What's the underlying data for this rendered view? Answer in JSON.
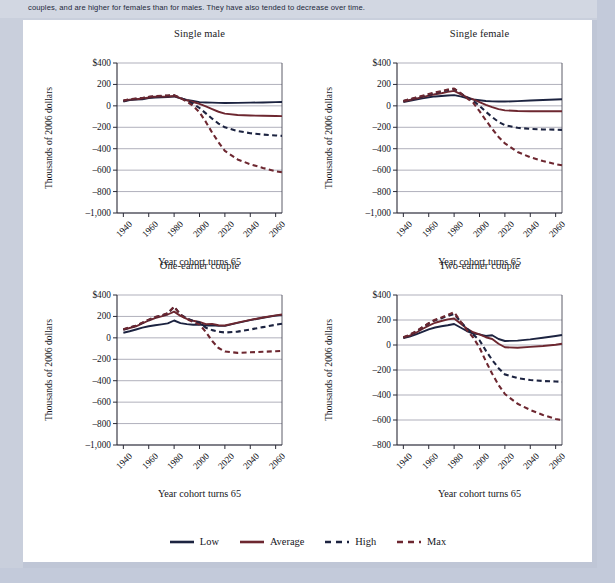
{
  "page": {
    "top_paragraph": "couples, and are higher for females than for males. They have also tended to decrease over time.",
    "background_color": "#c9cfdc",
    "panel_color": "#ffffff"
  },
  "legend": {
    "position": "bottom-center",
    "items": [
      {
        "label": "Low",
        "color": "#1c2340",
        "style": "solid"
      },
      {
        "label": "Average",
        "color": "#6d2730",
        "style": "solid"
      },
      {
        "label": "High",
        "color": "#1c2340",
        "style": "dashed"
      },
      {
        "label": "Max",
        "color": "#6d2730",
        "style": "dashed"
      }
    ]
  },
  "chart_data": [
    {
      "type": "line",
      "title": "Single male",
      "xlabel": "Year cohort turns 65",
      "ylabel": "Thousands of 2006 dollars",
      "xlim": [
        1935,
        2065
      ],
      "ylim": [
        -1000,
        400
      ],
      "xticks": [
        1940,
        1960,
        1980,
        2000,
        2020,
        2040,
        2060
      ],
      "yticks": [
        400,
        200,
        0,
        -200,
        -400,
        -600,
        -800,
        -1000
      ],
      "ytick_labels": [
        "$400",
        "200",
        "0",
        "–200",
        "–400",
        "–600",
        "–800",
        "–1,000"
      ],
      "grid": true,
      "x": [
        1940,
        1945,
        1950,
        1955,
        1960,
        1965,
        1970,
        1975,
        1980,
        1985,
        1990,
        1995,
        2000,
        2005,
        2010,
        2015,
        2020,
        2030,
        2040,
        2050,
        2060,
        2065
      ],
      "series": [
        {
          "name": "Low",
          "color": "#1c2340",
          "style": "solid",
          "values": [
            40,
            55,
            58,
            62,
            72,
            78,
            80,
            82,
            88,
            70,
            55,
            45,
            35,
            32,
            30,
            28,
            27,
            28,
            30,
            32,
            35,
            36
          ]
        },
        {
          "name": "Average",
          "color": "#6d2730",
          "style": "solid",
          "values": [
            45,
            58,
            62,
            68,
            78,
            85,
            86,
            88,
            92,
            72,
            52,
            36,
            18,
            -5,
            -30,
            -55,
            -72,
            -85,
            -90,
            -93,
            -95,
            -96
          ]
        },
        {
          "name": "High",
          "color": "#1c2340",
          "style": "dashed",
          "values": [
            48,
            60,
            66,
            72,
            82,
            90,
            92,
            94,
            98,
            74,
            48,
            20,
            -20,
            -70,
            -120,
            -165,
            -200,
            -235,
            -255,
            -268,
            -276,
            -280
          ]
        },
        {
          "name": "Max",
          "color": "#6d2730",
          "style": "dashed",
          "values": [
            50,
            62,
            68,
            74,
            84,
            92,
            94,
            96,
            100,
            72,
            40,
            0,
            -60,
            -150,
            -250,
            -340,
            -420,
            -500,
            -545,
            -580,
            -610,
            -620
          ]
        }
      ]
    },
    {
      "type": "line",
      "title": "Single female",
      "xlabel": "Year cohort turns 65",
      "ylabel": "Thousands of 2006 dollars",
      "xlim": [
        1935,
        2065
      ],
      "ylim": [
        -1000,
        400
      ],
      "xticks": [
        1940,
        1960,
        1980,
        2000,
        2020,
        2040,
        2060
      ],
      "yticks": [
        400,
        200,
        0,
        -200,
        -400,
        -600,
        -800,
        -1000
      ],
      "ytick_labels": [
        "$400",
        "200",
        "0",
        "–200",
        "–400",
        "–600",
        "–800",
        "–1,000"
      ],
      "grid": true,
      "x": [
        1940,
        1945,
        1950,
        1955,
        1960,
        1965,
        1970,
        1975,
        1980,
        1985,
        1990,
        1995,
        2000,
        2005,
        2010,
        2015,
        2020,
        2030,
        2040,
        2050,
        2060,
        2065
      ],
      "series": [
        {
          "name": "Low",
          "color": "#1c2340",
          "style": "solid",
          "values": [
            35,
            48,
            58,
            70,
            80,
            88,
            92,
            96,
            100,
            88,
            72,
            60,
            52,
            45,
            42,
            40,
            40,
            44,
            50,
            55,
            60,
            62
          ]
        },
        {
          "name": "Average",
          "color": "#6d2730",
          "style": "solid",
          "values": [
            40,
            55,
            68,
            82,
            95,
            108,
            118,
            130,
            140,
            110,
            82,
            60,
            35,
            10,
            -12,
            -30,
            -42,
            -48,
            -50,
            -50,
            -50,
            -50
          ]
        },
        {
          "name": "High",
          "color": "#1c2340",
          "style": "dashed",
          "values": [
            45,
            60,
            75,
            90,
            105,
            120,
            132,
            146,
            158,
            118,
            80,
            48,
            0,
            -55,
            -105,
            -150,
            -180,
            -205,
            -215,
            -220,
            -222,
            -224
          ]
        },
        {
          "name": "Max",
          "color": "#6d2730",
          "style": "dashed",
          "values": [
            46,
            62,
            78,
            94,
            110,
            125,
            138,
            152,
            162,
            118,
            72,
            30,
            -50,
            -135,
            -215,
            -290,
            -350,
            -430,
            -480,
            -515,
            -545,
            -555
          ]
        }
      ]
    },
    {
      "type": "line",
      "title": "One-earner couple",
      "xlabel": "Year cohort turns 65",
      "ylabel": "Thousands of 2006 dollars",
      "xlim": [
        1935,
        2065
      ],
      "ylim": [
        -1000,
        400
      ],
      "xticks": [
        1940,
        1960,
        1980,
        2000,
        2020,
        2040,
        2060
      ],
      "yticks": [
        400,
        200,
        0,
        -200,
        -400,
        -600,
        -800,
        -1000
      ],
      "ytick_labels": [
        "$400",
        "200",
        "0",
        "–200",
        "–400",
        "–600",
        "–800",
        "–1,000"
      ],
      "grid": true,
      "x": [
        1940,
        1945,
        1950,
        1955,
        1960,
        1965,
        1970,
        1975,
        1980,
        1985,
        1990,
        1995,
        2000,
        2005,
        2010,
        2015,
        2020,
        2030,
        2040,
        2050,
        2060,
        2065
      ],
      "series": [
        {
          "name": "Low",
          "color": "#1c2340",
          "style": "solid",
          "values": [
            48,
            62,
            78,
            95,
            108,
            118,
            126,
            135,
            162,
            138,
            128,
            122,
            125,
            115,
            118,
            112,
            112,
            140,
            165,
            188,
            208,
            215
          ]
        },
        {
          "name": "Average",
          "color": "#6d2730",
          "style": "solid",
          "values": [
            75,
            92,
            108,
            135,
            162,
            185,
            200,
            218,
            245,
            205,
            178,
            160,
            148,
            128,
            130,
            118,
            115,
            142,
            168,
            190,
            210,
            218
          ]
        },
        {
          "name": "High",
          "color": "#1c2340",
          "style": "dashed",
          "values": [
            78,
            96,
            112,
            140,
            168,
            192,
            208,
            228,
            290,
            218,
            182,
            158,
            140,
            95,
            72,
            58,
            50,
            58,
            78,
            100,
            122,
            132
          ]
        },
        {
          "name": "Max",
          "color": "#6d2730",
          "style": "dashed",
          "values": [
            80,
            98,
            114,
            142,
            170,
            194,
            210,
            230,
            292,
            215,
            175,
            148,
            125,
            55,
            -30,
            -95,
            -128,
            -140,
            -135,
            -130,
            -125,
            -122
          ]
        }
      ]
    },
    {
      "type": "line",
      "title": "Two-earner couple",
      "xlabel": "Year cohort turns 65",
      "ylabel": "Thousands of 2006 dollars",
      "xlim": [
        1935,
        2065
      ],
      "ylim": [
        -800,
        400
      ],
      "xticks": [
        1940,
        1960,
        1980,
        2000,
        2020,
        2040,
        2060
      ],
      "yticks": [
        400,
        200,
        0,
        -200,
        -400,
        -600,
        -800
      ],
      "ytick_labels": [
        "$400",
        "200",
        "0",
        "–200",
        "–400",
        "–600",
        "–800"
      ],
      "grid": true,
      "x": [
        1940,
        1945,
        1950,
        1955,
        1960,
        1965,
        1970,
        1975,
        1980,
        1985,
        1990,
        1995,
        2000,
        2005,
        2010,
        2015,
        2020,
        2030,
        2040,
        2050,
        2060,
        2065
      ],
      "series": [
        {
          "name": "Low",
          "color": "#1c2340",
          "style": "solid",
          "values": [
            55,
            68,
            85,
            105,
            125,
            140,
            150,
            158,
            168,
            140,
            112,
            92,
            85,
            72,
            78,
            48,
            32,
            35,
            45,
            58,
            72,
            80
          ]
        },
        {
          "name": "Average",
          "color": "#6d2730",
          "style": "solid",
          "values": [
            58,
            75,
            98,
            128,
            155,
            178,
            192,
            205,
            212,
            172,
            132,
            102,
            85,
            62,
            48,
            10,
            -18,
            -22,
            -15,
            -8,
            2,
            10
          ]
        },
        {
          "name": "High",
          "color": "#1c2340",
          "style": "dashed",
          "values": [
            60,
            80,
            108,
            140,
            172,
            198,
            215,
            232,
            248,
            188,
            132,
            85,
            38,
            -45,
            -120,
            -185,
            -235,
            -265,
            -280,
            -288,
            -292,
            -295
          ]
        },
        {
          "name": "Max",
          "color": "#6d2730",
          "style": "dashed",
          "values": [
            62,
            82,
            110,
            142,
            175,
            202,
            220,
            240,
            262,
            190,
            120,
            60,
            -20,
            -130,
            -230,
            -320,
            -392,
            -470,
            -520,
            -560,
            -592,
            -600
          ]
        }
      ]
    }
  ]
}
